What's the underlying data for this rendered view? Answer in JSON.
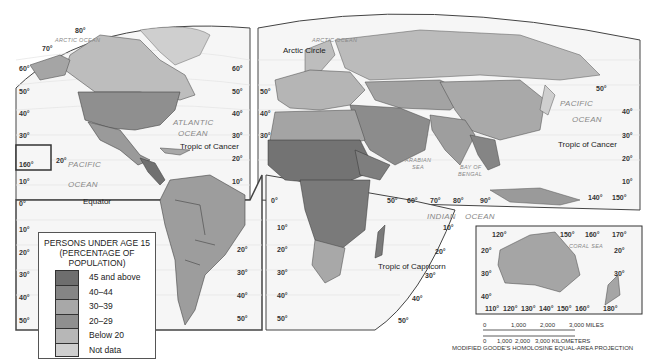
{
  "legend": {
    "title_lines": [
      "PERSONS UNDER AGE 15",
      "(PERCENTAGE OF",
      "POPULATION)"
    ],
    "items": [
      {
        "label": "45 and above",
        "color": "#6e6e6e"
      },
      {
        "label": "40–44",
        "color": "#858585"
      },
      {
        "label": "30–39",
        "color": "#a8a8a8"
      },
      {
        "label": "20–29",
        "color": "#8f8f8f"
      },
      {
        "label": "Below 20",
        "color": "#b7b7b7"
      },
      {
        "label": "Not data",
        "color": "#cfcfcf"
      }
    ]
  },
  "oceans": {
    "arctic_left": "ARCTIC OCEAN",
    "arctic_right": "ARCTIC OCEAN",
    "atlantic_1": "ATLANTIC",
    "atlantic_2": "OCEAN",
    "pacific_left_1": "PACIFIC",
    "pacific_left_2": "OCEAN",
    "pacific_right_1": "PACIFIC",
    "pacific_right_2": "OCEAN",
    "indian_1": "INDIAN",
    "indian_2": "OCEAN",
    "arabian_1": "ARABIAN",
    "arabian_2": "SEA",
    "bengal_1": "BAY OF",
    "bengal_2": "BENGAL",
    "coral_sea": "CORAL SEA"
  },
  "lines": {
    "arctic_circle": "Arctic Circle",
    "tropic_cancer_left": "Tropic of Cancer",
    "tropic_cancer_right": "Tropic of Cancer",
    "equator": "Equator",
    "tropic_capricorn": "Tropic of Capricorn"
  },
  "graticule": {
    "left_lat": [
      "60°",
      "50°",
      "40°",
      "30°",
      "10°",
      "0°",
      "10°",
      "20°",
      "30°",
      "40°",
      "50°"
    ],
    "top_left": [
      "80°",
      "70°"
    ],
    "mid_left": [
      "60°",
      "50°",
      "40°",
      "30°",
      "20°",
      "10°",
      "20°",
      "30°",
      "40°",
      "50°"
    ],
    "mid_right": [
      "50°",
      "40°",
      "30°",
      "0°",
      "10°",
      "20°",
      "30°",
      "40°",
      "50°"
    ],
    "hawaii": [
      "160°",
      "20°"
    ],
    "long_bottom": [
      "50°",
      "60°",
      "70°",
      "80°",
      "90°"
    ],
    "africa_right": [
      "10°",
      "20°",
      "30°",
      "40°",
      "50°"
    ],
    "right_edge": [
      "50°",
      "40°",
      "30°",
      "20°",
      "10°"
    ],
    "pacific_long": [
      "140°",
      "150°"
    ],
    "australia_top": [
      "120°",
      "150°",
      "160°",
      "170°"
    ],
    "australia_left": [
      "20°",
      "30°",
      "40°"
    ],
    "australia_right": [
      "20°",
      "30°"
    ],
    "australia_bottom": [
      "110°",
      "120°",
      "130°",
      "140°",
      "150°",
      "160°",
      "180°"
    ]
  },
  "scale": {
    "miles": [
      "0",
      "1,000",
      "2,000",
      "3,000 MILES"
    ],
    "km": [
      "0",
      "1,000",
      "2,000",
      "3,000 KILOMETERS"
    ]
  },
  "projection": "MODIFIED GOODE'S HOMOLOSINE EQUAL-AREA PROJECTION"
}
